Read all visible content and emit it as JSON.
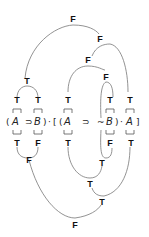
{
  "diagram": {
    "type": "truth-value tree",
    "formula": {
      "tokens": [
        "(",
        "A",
        "⊃",
        "B",
        ")",
        "·",
        "[",
        "(",
        "A",
        "⊃",
        "~",
        "B",
        ")",
        "·",
        "A",
        "]"
      ],
      "text": "(A ⊃ B)·[(A ⊃ ~B)·A]"
    },
    "top_labels": {
      "root": "F",
      "right_conj": "F",
      "inner_cond": "F",
      "left_cond": "T",
      "A1": "T",
      "B1": "T",
      "A2": "T",
      "B2": "T",
      "A3": "T"
    },
    "bottom_labels": {
      "A1": "T",
      "B1": "F",
      "A2": "T",
      "notB": "F",
      "A3": "T",
      "left_cond": "F",
      "inner_negB": "T",
      "inner_cond": "T",
      "right_conj": "T",
      "root": "F"
    }
  }
}
